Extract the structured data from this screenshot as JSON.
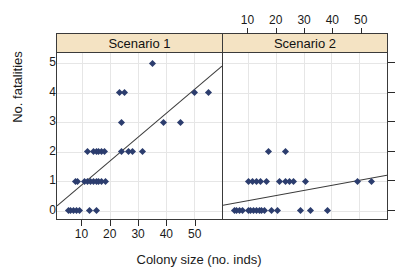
{
  "chart_data": {
    "type": "scatter",
    "title": "",
    "xlabel": "Colony size (no. inds)",
    "ylabel": "No. fatalities",
    "xlim": [
      1,
      60
    ],
    "ylim": [
      -0.35,
      5.35
    ],
    "xticks": [
      10,
      20,
      30,
      40,
      50
    ],
    "yticks": [
      0,
      1,
      2,
      3,
      4,
      5
    ],
    "grid": true,
    "legend": "none",
    "point_color": "#2c3d6e",
    "line_color": "#3a3a3a",
    "strip_color": "#f4e3c3",
    "panels": [
      {
        "label": "Scenario 1",
        "xaxis_position": "bottom",
        "points": [
          {
            "x": 5.0,
            "y": 0
          },
          {
            "x": 6.0,
            "y": 0
          },
          {
            "x": 7.0,
            "y": 0
          },
          {
            "x": 8.0,
            "y": 0
          },
          {
            "x": 9.0,
            "y": 0
          },
          {
            "x": 12.5,
            "y": 0
          },
          {
            "x": 15.0,
            "y": 0
          },
          {
            "x": 7.5,
            "y": 1
          },
          {
            "x": 8.5,
            "y": 1
          },
          {
            "x": 11.0,
            "y": 1
          },
          {
            "x": 12.0,
            "y": 1
          },
          {
            "x": 13.0,
            "y": 1
          },
          {
            "x": 14.0,
            "y": 1
          },
          {
            "x": 15.0,
            "y": 1
          },
          {
            "x": 16.0,
            "y": 1
          },
          {
            "x": 17.0,
            "y": 1
          },
          {
            "x": 18.5,
            "y": 1
          },
          {
            "x": 12.0,
            "y": 2
          },
          {
            "x": 14.0,
            "y": 2
          },
          {
            "x": 15.0,
            "y": 2
          },
          {
            "x": 16.0,
            "y": 2
          },
          {
            "x": 17.0,
            "y": 2
          },
          {
            "x": 18.0,
            "y": 2
          },
          {
            "x": 24.0,
            "y": 2
          },
          {
            "x": 26.5,
            "y": 2
          },
          {
            "x": 28.0,
            "y": 2
          },
          {
            "x": 31.5,
            "y": 2
          },
          {
            "x": 24.0,
            "y": 3
          },
          {
            "x": 39.0,
            "y": 3
          },
          {
            "x": 45.0,
            "y": 3
          },
          {
            "x": 23.5,
            "y": 4
          },
          {
            "x": 25.0,
            "y": 4
          },
          {
            "x": 50.0,
            "y": 4
          },
          {
            "x": 55.0,
            "y": 4
          },
          {
            "x": 35.0,
            "y": 5
          }
        ],
        "fit_line": {
          "x0": 1,
          "y0": 0.1,
          "x1": 60,
          "y1": 4.9
        }
      },
      {
        "label": "Scenario 2",
        "xaxis_position": "top",
        "points": [
          {
            "x": 5.0,
            "y": 0
          },
          {
            "x": 6.0,
            "y": 0
          },
          {
            "x": 7.0,
            "y": 0
          },
          {
            "x": 8.0,
            "y": 0
          },
          {
            "x": 10.0,
            "y": 0
          },
          {
            "x": 11.0,
            "y": 0
          },
          {
            "x": 12.0,
            "y": 0
          },
          {
            "x": 13.0,
            "y": 0
          },
          {
            "x": 14.0,
            "y": 0
          },
          {
            "x": 15.0,
            "y": 0
          },
          {
            "x": 16.0,
            "y": 0
          },
          {
            "x": 18.5,
            "y": 0
          },
          {
            "x": 20.5,
            "y": 0
          },
          {
            "x": 29.0,
            "y": 0
          },
          {
            "x": 32.5,
            "y": 0
          },
          {
            "x": 38.5,
            "y": 0
          },
          {
            "x": 10.0,
            "y": 1
          },
          {
            "x": 11.5,
            "y": 1
          },
          {
            "x": 13.0,
            "y": 1
          },
          {
            "x": 14.5,
            "y": 1
          },
          {
            "x": 16.5,
            "y": 1
          },
          {
            "x": 21.5,
            "y": 1
          },
          {
            "x": 23.5,
            "y": 1
          },
          {
            "x": 25.0,
            "y": 1
          },
          {
            "x": 26.5,
            "y": 1
          },
          {
            "x": 30.5,
            "y": 1
          },
          {
            "x": 49.5,
            "y": 1
          },
          {
            "x": 54.5,
            "y": 1
          },
          {
            "x": 17.5,
            "y": 2
          },
          {
            "x": 23.5,
            "y": 2
          }
        ],
        "fit_line": {
          "x0": 1,
          "y0": 0.12,
          "x1": 60,
          "y1": 1.15
        }
      }
    ]
  }
}
